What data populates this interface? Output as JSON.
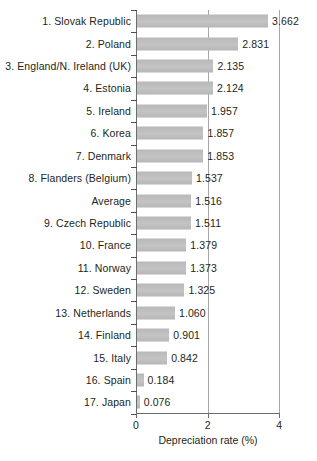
{
  "chart_data": {
    "type": "bar",
    "orientation": "horizontal",
    "title": "",
    "xlabel": "Depreciation rate (%)",
    "ylabel": "",
    "xlim": [
      0,
      4
    ],
    "xticks": [
      "0",
      "2",
      "4"
    ],
    "xtick_values": [
      0,
      2,
      4
    ],
    "grid": "vertical",
    "legend": "none",
    "bar_color": "#c0c0c0",
    "text_color": "#231f20",
    "axis_color": "#6d6d6d",
    "categories": [
      "1. Slovak Republic",
      "2. Poland",
      "3. England/N. Ireland (UK)",
      "4. Estonia",
      "5. Ireland",
      "6. Korea",
      "7. Denmark",
      "8. Flanders (Belgium)",
      "Average",
      "9. Czech Republic",
      "10. France",
      "11. Norway",
      "12. Sweden",
      "13. Netherlands",
      "14. Finland",
      "15. Italy",
      "16. Spain",
      "17. Japan"
    ],
    "values": [
      3.662,
      2.831,
      2.135,
      2.124,
      1.957,
      1.857,
      1.853,
      1.537,
      1.516,
      1.511,
      1.379,
      1.373,
      1.325,
      1.06,
      0.901,
      0.842,
      0.184,
      0.076
    ],
    "value_labels": [
      "3.662",
      "2.831",
      "2.135",
      "2.124",
      "1.957",
      "1.857",
      "1.853",
      "1.537",
      "1.516",
      "1.511",
      "1.379",
      "1.373",
      "1.325",
      "1.060",
      "0.901",
      "0.842",
      "0.184",
      "0.076"
    ]
  }
}
